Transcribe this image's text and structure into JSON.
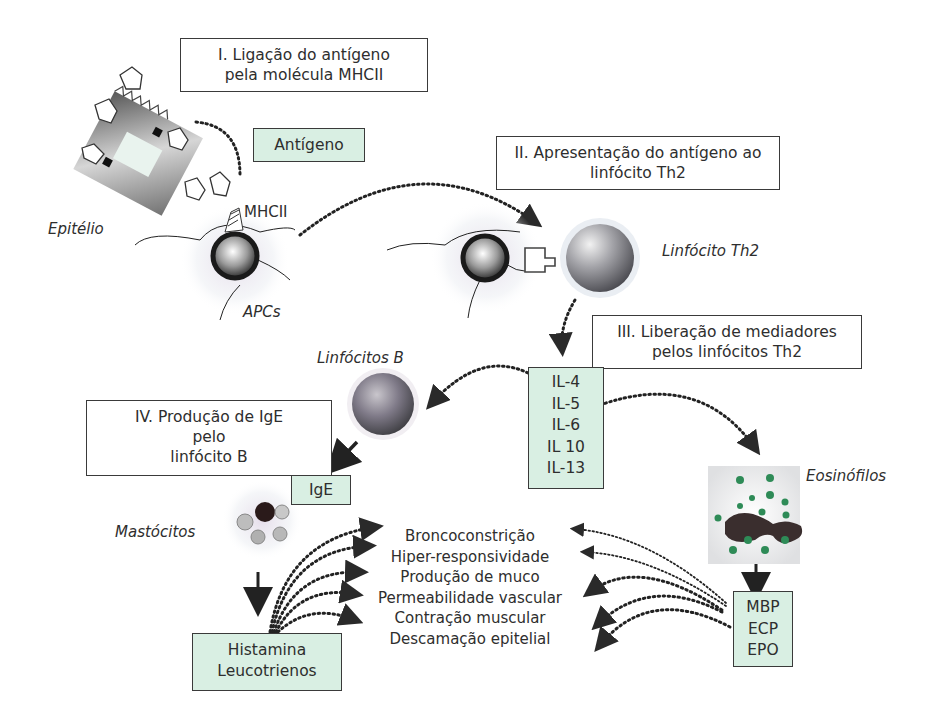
{
  "figure": {
    "steps": [
      {
        "id": "I",
        "lines": [
          "I.  Ligação do antígeno",
          "pela molécula MHCII"
        ]
      },
      {
        "id": "II",
        "lines": [
          "II.  Apresentação do antígeno ao",
          "linfócito Th2"
        ]
      },
      {
        "id": "III",
        "lines": [
          "III. Liberação de mediadores",
          "pelos linfócitos Th2"
        ]
      },
      {
        "id": "IV",
        "lines": [
          "IV. Produção de IgE",
          "pelo",
          "linfócito B"
        ]
      }
    ],
    "labels": {
      "antigen": "Antígeno",
      "epithelium": "Epitélio",
      "mhcii": "MHCII",
      "apcs": "APCs",
      "th2": "Linfócito Th2",
      "b_cells": "Linfócitos B",
      "mast_cells": "Mastócitos",
      "eosinophils": "Eosinófilos",
      "ige": "IgE"
    },
    "cytokines": [
      "IL-4",
      "IL-5",
      "IL-6",
      "IL 10",
      "IL-13"
    ],
    "mast_mediators": [
      "Histamina",
      "Leucotrienos"
    ],
    "eosinophil_mediators": [
      "MBP",
      "ECP",
      "EPO"
    ],
    "effects": [
      "Broncoconstrição",
      "Hiper-responsividade",
      "Produção de muco",
      "Permeabilidade vascular",
      "Contração muscular",
      "Descamação epitelial"
    ],
    "colors": {
      "green_box": "#d9efe3",
      "border": "#3a3a3a",
      "eosinophil_granule": "#2e8b57",
      "text": "#2e2e2e"
    }
  }
}
